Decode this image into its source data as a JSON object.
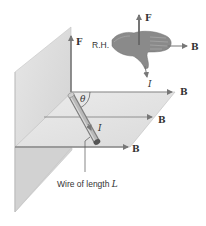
{
  "figure": {
    "labels": {
      "force_vector": "F",
      "field_vector": "B",
      "current": "I",
      "angle": "θ",
      "right_hand": "R.H.",
      "wire_caption": "Wire of length L",
      "wire_caption_prefix": "Wire of length ",
      "wire_caption_var": "L"
    },
    "field_lines": [
      {
        "label": "B"
      },
      {
        "label": "B"
      },
      {
        "label": "B"
      }
    ],
    "hand_diagram": {
      "label": "R.H.",
      "arrows": [
        {
          "label": "F",
          "direction": "up"
        },
        {
          "label": "B",
          "direction": "right"
        },
        {
          "label": "I",
          "direction": "down-right"
        }
      ]
    },
    "colors": {
      "plane_fill": "#dcdcdc",
      "plane_edge": "#bdbdbd",
      "arrow": "#7a7a7a",
      "wire": "#9a9a9a",
      "hand": "#8c8c8c",
      "text": "#333333"
    }
  }
}
